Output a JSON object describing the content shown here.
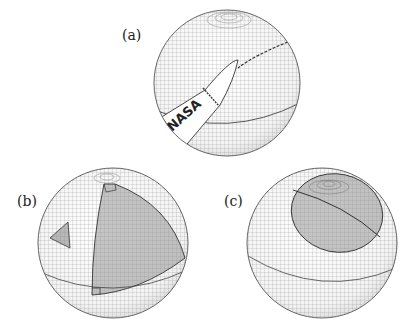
{
  "figure": {
    "panels": [
      {
        "id": "a",
        "label": "(a)",
        "description": "sphere with NASA rocket decal and a great-circle arc",
        "decal_text": "NASA"
      },
      {
        "id": "b",
        "label": "(b)",
        "description": "sphere with shaded spherical triangle (three right angles) and a small triangle"
      },
      {
        "id": "c",
        "label": "(c)",
        "description": "sphere with shaded spherical cap split by a great circle"
      }
    ],
    "colors": {
      "grid": "#7a7a7a",
      "shade": "#8c8c8c",
      "outline": "#333333",
      "background": "#ffffff"
    }
  }
}
